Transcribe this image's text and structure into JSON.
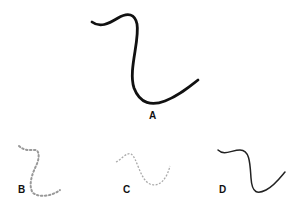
{
  "figures": [
    {
      "label": "A",
      "style": "solid thick",
      "color": "#111111"
    },
    {
      "label": "B",
      "style": "dotted",
      "color": "#888888"
    },
    {
      "label": "C",
      "style": "dashed light",
      "color": "#aaaaaa"
    },
    {
      "label": "D",
      "style": "solid thin",
      "color": "#222222"
    }
  ]
}
